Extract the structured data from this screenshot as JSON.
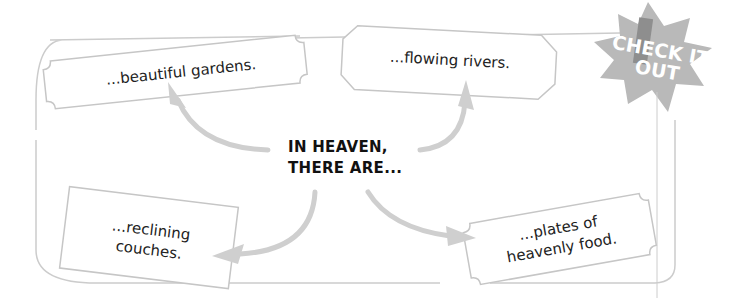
{
  "diagram": {
    "center_label": {
      "line1": "IN HEAVEN,",
      "line2": "THERE ARE..."
    },
    "nodes": [
      {
        "id": "gardens",
        "line1": "...beautiful gardens.",
        "line2": "",
        "position": "top-left"
      },
      {
        "id": "rivers",
        "line1": "...flowing rivers.",
        "line2": "",
        "position": "top-right"
      },
      {
        "id": "couches",
        "line1": "...reclining",
        "line2": "couches.",
        "position": "bottom-left"
      },
      {
        "id": "food",
        "line1": "...plates of",
        "line2": "heavenly food.",
        "position": "bottom-right"
      }
    ],
    "badge": {
      "line1": "CHECK IT",
      "line2": "OUT",
      "icon": "exclamation-icon"
    },
    "colors": {
      "frame": "#cccccc",
      "arrow": "#cfcfcf",
      "badge_fill": "#b9b9b9",
      "badge_exclamation": "#8e8e8e",
      "text": "#222222"
    }
  }
}
